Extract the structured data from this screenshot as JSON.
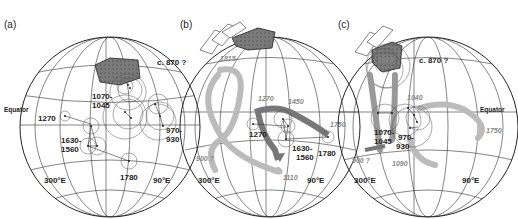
{
  "figure": {
    "panels": [
      {
        "id": "a",
        "label": "(a)",
        "labels": {
          "equator": "Equator",
          "c870": "c. 870 ?",
          "age_1070_a": "1070-",
          "age_1070_b": "1045",
          "age_1270": "1270",
          "age_1630_a": "1630-",
          "age_1630_b": "1560",
          "age_970_a": "970-",
          "age_970_b": "930",
          "age_1780": "1780",
          "lon_300": "300°E",
          "lon_90": "90°E"
        }
      },
      {
        "id": "b",
        "label": "(b)",
        "labels": {
          "age_1815": "1815",
          "age_1270_it": "1270",
          "age_1450": "1450",
          "age_1270": "1270",
          "age_1630_a": "1630-",
          "age_1630_b": "1560",
          "age_1780": "1780",
          "age_1750_it": "1750",
          "age_900": "900 ?",
          "age_1110": "1110",
          "lon_300": "300°E",
          "lon_90": "90°E"
        }
      },
      {
        "id": "c",
        "label": "(c)",
        "labels": {
          "equator": "Equator",
          "c870": "c. 870 ?",
          "age_1015": "1015",
          "age_1040": "1040",
          "age_1070_a": "1070-",
          "age_1070_b": "1045",
          "age_970_a": "970-",
          "age_970_b": "930",
          "age_1750_it": "1750",
          "age_900": "900 ?",
          "age_1090": "1090",
          "lon_300": "300°E",
          "lon_90": "90°E"
        }
      }
    ]
  }
}
